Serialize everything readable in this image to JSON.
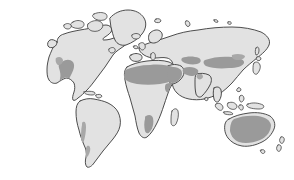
{
  "figure": {
    "kind": "world-map",
    "title": "",
    "subtitle": "",
    "caption": "",
    "background_color": "#ffffff",
    "has_legend": false,
    "has_labels": false,
    "has_graticule": false,
    "projection_look": "equal-area world map, oval continents"
  },
  "palette": {
    "land_fill": "#e2e2e2",
    "land_outline": "#3a3a3a",
    "highlight_fill": "#9a9a9a",
    "highlight_fill_soft": "#a8a8a8",
    "background": "#ffffff"
  },
  "layers": [
    {
      "id": "land",
      "name": "Landmasses",
      "fill": "#e2e2e2",
      "stroke": "#3a3a3a"
    },
    {
      "id": "arid",
      "name": "Highlighted arid regions",
      "fill": "#9a9a9a",
      "stroke": "none"
    }
  ],
  "continents": [
    {
      "id": "north-america",
      "name": "North America"
    },
    {
      "id": "greenland",
      "name": "Greenland"
    },
    {
      "id": "south-america",
      "name": "South America"
    },
    {
      "id": "africa",
      "name": "Africa"
    },
    {
      "id": "europe",
      "name": "Europe"
    },
    {
      "id": "asia",
      "name": "Asia"
    },
    {
      "id": "australia",
      "name": "Australia"
    }
  ],
  "islands": [
    {
      "id": "iceland",
      "name": "Iceland"
    },
    {
      "id": "british-isles",
      "name": "British Isles"
    },
    {
      "id": "ireland",
      "name": "Ireland"
    },
    {
      "id": "madagascar",
      "name": "Madagascar"
    },
    {
      "id": "japan",
      "name": "Japan"
    },
    {
      "id": "new-zealand-north",
      "name": "New Zealand North Island"
    },
    {
      "id": "new-zealand-south",
      "name": "New Zealand South Island"
    },
    {
      "id": "borneo",
      "name": "Borneo"
    },
    {
      "id": "sumatra",
      "name": "Sumatra"
    },
    {
      "id": "new-guinea",
      "name": "New Guinea"
    },
    {
      "id": "philippines",
      "name": "Philippines"
    },
    {
      "id": "sulawesi",
      "name": "Sulawesi"
    },
    {
      "id": "java",
      "name": "Java"
    },
    {
      "id": "cuba",
      "name": "Cuba"
    },
    {
      "id": "hispaniola",
      "name": "Hispaniola"
    },
    {
      "id": "sri-lanka",
      "name": "Sri Lanka"
    },
    {
      "id": "tasmania",
      "name": "Tasmania"
    },
    {
      "id": "svalbard",
      "name": "Svalbard"
    },
    {
      "id": "novaya-zemlya",
      "name": "Novaya Zemlya"
    },
    {
      "id": "baffin",
      "name": "Baffin Island"
    },
    {
      "id": "newfoundland",
      "name": "Newfoundland"
    },
    {
      "id": "sakhalin",
      "name": "Sakhalin"
    },
    {
      "id": "taiwan",
      "name": "Taiwan"
    },
    {
      "id": "hokkaido",
      "name": "Hokkaido"
    }
  ],
  "highlighted_regions": [
    {
      "id": "sonoran-chihuahuan",
      "name": "North American southwest deserts",
      "continent": "north-america"
    },
    {
      "id": "atacama",
      "name": "Atacama coastal desert",
      "continent": "south-america"
    },
    {
      "id": "patagonia",
      "name": "Patagonian steppe",
      "continent": "south-america"
    },
    {
      "id": "sahara",
      "name": "Sahara",
      "continent": "africa"
    },
    {
      "id": "horn-sahel",
      "name": "Horn of Africa drylands",
      "continent": "africa"
    },
    {
      "id": "arabian",
      "name": "Arabian desert",
      "continent": "asia"
    },
    {
      "id": "iranian-plateau",
      "name": "Iranian plateau drylands",
      "continent": "asia"
    },
    {
      "id": "kalahari-namib",
      "name": "Kalahari and Namib",
      "continent": "africa"
    },
    {
      "id": "karakum-kyzylkum",
      "name": "Central Asian deserts",
      "continent": "asia"
    },
    {
      "id": "taklamakan-gobi",
      "name": "Taklamakan and Gobi",
      "continent": "asia"
    },
    {
      "id": "thar",
      "name": "Thar desert",
      "continent": "asia"
    },
    {
      "id": "australian-interior",
      "name": "Australian interior deserts",
      "continent": "australia"
    }
  ]
}
